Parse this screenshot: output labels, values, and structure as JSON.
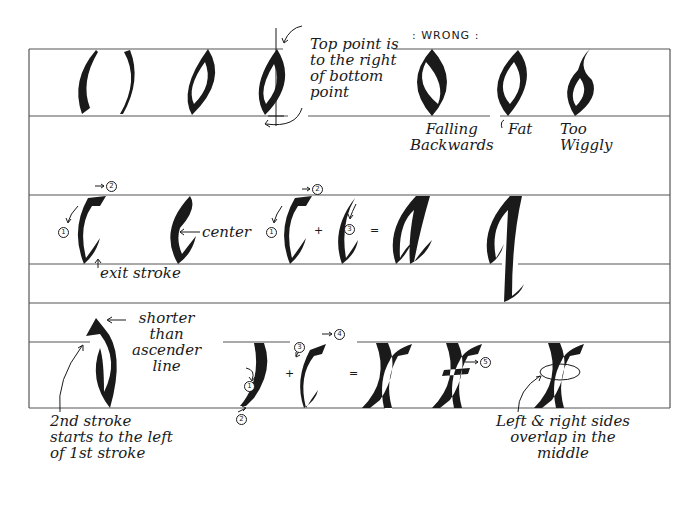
{
  "diagram": {
    "colors": {
      "ink": "#1a1a1a",
      "guide_line": "#555555",
      "background": "#ffffff"
    }
  },
  "row1": {
    "letters": [
      "( )",
      "o",
      "o"
    ],
    "annotation_top_point": "Top point is\nto the right\nof bottom\npoint",
    "wrong_label": ": WRONG :",
    "wrong_examples": [
      {
        "label": "Falling\nBackwards"
      },
      {
        "label": "Fat"
      },
      {
        "label": "Too\nWiggly"
      }
    ]
  },
  "row2": {
    "letters": [
      "c",
      "e",
      "c",
      "c",
      "a",
      "q"
    ],
    "annotation_exit_stroke": "exit stroke",
    "annotation_center": "center",
    "stroke_numbers": [
      "1",
      "2",
      "1",
      "2",
      "3"
    ],
    "operators": [
      "+",
      "="
    ]
  },
  "row3": {
    "letters": [
      "d",
      "x",
      "x",
      "x"
    ],
    "annotation_shorter": "shorter\nthan\nascender\nline",
    "annotation_second_stroke": "2nd stroke\nstarts to the left\nof 1st stroke",
    "annotation_overlap": "Left & right sides\noverlap in the\nmiddle",
    "stroke_numbers": [
      "1",
      "2",
      "3",
      "4",
      "5"
    ],
    "operators": [
      "+",
      "="
    ]
  }
}
